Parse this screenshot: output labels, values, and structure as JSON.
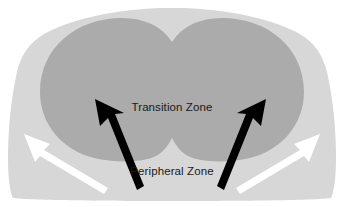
{
  "diagram": {
    "type": "anatomical-zone-diagram",
    "background_color": "#ffffff",
    "labels": {
      "transition_zone": "Transition Zone",
      "peripheral_zone": "Peripheral Zone"
    },
    "zones": [
      {
        "name": "peripheral-zone",
        "label": "Peripheral Zone",
        "color": "#d7d7d7",
        "description": "Outer light-gray capsule region forming the rounded dome outline"
      },
      {
        "name": "transition-zone",
        "label": "Transition Zone",
        "color": "#ababab",
        "description": "Inner darker gray bilobed (heart-shaped) region occupying the upper centre"
      }
    ],
    "arrows": [
      {
        "name": "black-arrow-left",
        "color": "#000000",
        "direction": "up-left",
        "points_to": "transition-zone"
      },
      {
        "name": "black-arrow-right",
        "color": "#000000",
        "direction": "up-right",
        "points_to": "transition-zone"
      },
      {
        "name": "white-arrow-left",
        "color": "#ffffff",
        "direction": "up-left",
        "points_to": "peripheral-zone"
      },
      {
        "name": "white-arrow-right",
        "color": "#ffffff",
        "direction": "up-right",
        "points_to": "peripheral-zone"
      }
    ],
    "label_positions": {
      "transition_zone": {
        "x": 172,
        "y": 111
      },
      "peripheral_zone": {
        "x": 172,
        "y": 175
      }
    }
  }
}
